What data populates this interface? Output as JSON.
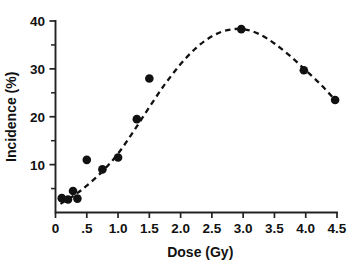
{
  "chart_data": {
    "type": "scatter",
    "title": "",
    "subtitle": "",
    "xlabel": "Dose (Gy)",
    "ylabel": "Incidence (%)",
    "xlim": [
      0,
      4.5
    ],
    "ylim": [
      0,
      40
    ],
    "grid": false,
    "legend": null,
    "legend_position": "none",
    "x_ticks": [
      0,
      0.5,
      1.0,
      1.5,
      2.0,
      2.5,
      3.0,
      3.5,
      4.0,
      4.5
    ],
    "x_tick_labels": [
      "0",
      ".5",
      "1.0",
      "1.5",
      "2.0",
      "2.5",
      "3.0",
      "3.5",
      "4.0",
      "4.5"
    ],
    "y_ticks": [
      10,
      20,
      30,
      40
    ],
    "y_tick_labels": [
      "10",
      "20",
      "30",
      "40"
    ],
    "y_minor_ticks": [
      5,
      15,
      25,
      35
    ],
    "marker_style": "filled-circle",
    "marker_color": "#111111",
    "curve_style": "dashed",
    "curve_color": "#111111",
    "series": [
      {
        "name": "Observed incidence",
        "type": "scatter",
        "points": [
          {
            "x": 0.1,
            "y": 3.0
          },
          {
            "x": 0.2,
            "y": 2.7
          },
          {
            "x": 0.28,
            "y": 4.5
          },
          {
            "x": 0.35,
            "y": 2.9
          },
          {
            "x": 0.5,
            "y": 11.0
          },
          {
            "x": 0.75,
            "y": 9.0
          },
          {
            "x": 1.0,
            "y": 11.5
          },
          {
            "x": 1.3,
            "y": 19.5
          },
          {
            "x": 1.5,
            "y": 28.0
          },
          {
            "x": 2.97,
            "y": 38.3
          },
          {
            "x": 3.97,
            "y": 29.7
          },
          {
            "x": 4.47,
            "y": 23.5
          }
        ]
      },
      {
        "name": "Fitted dose-response curve",
        "type": "line",
        "points": [
          {
            "x": 0.08,
            "y": 1.8
          },
          {
            "x": 0.3,
            "y": 3.6
          },
          {
            "x": 0.5,
            "y": 5.6
          },
          {
            "x": 0.75,
            "y": 8.6
          },
          {
            "x": 1.0,
            "y": 12.3
          },
          {
            "x": 1.25,
            "y": 17.0
          },
          {
            "x": 1.5,
            "y": 22.0
          },
          {
            "x": 1.75,
            "y": 26.8
          },
          {
            "x": 2.0,
            "y": 31.0
          },
          {
            "x": 2.25,
            "y": 34.4
          },
          {
            "x": 2.5,
            "y": 36.8
          },
          {
            "x": 2.75,
            "y": 38.1
          },
          {
            "x": 3.0,
            "y": 38.3
          },
          {
            "x": 3.25,
            "y": 37.3
          },
          {
            "x": 3.5,
            "y": 35.3
          },
          {
            "x": 3.75,
            "y": 32.7
          },
          {
            "x": 4.0,
            "y": 29.7
          },
          {
            "x": 4.25,
            "y": 26.6
          },
          {
            "x": 4.47,
            "y": 23.5
          }
        ]
      }
    ]
  }
}
